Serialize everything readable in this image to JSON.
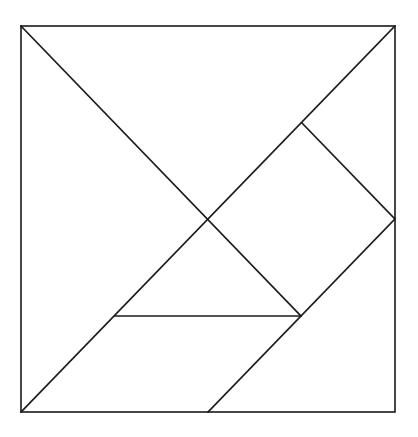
{
  "diagram": {
    "type": "tangram",
    "canvas": {
      "width": 418,
      "height": 437
    },
    "stroke_color": "#1a1a1a",
    "background": "#ffffff",
    "outer_square": {
      "x1": 21,
      "y1": 26,
      "x2": 395,
      "y2": 412
    },
    "pieces": [
      {
        "name": "large-triangle-top",
        "points": "21,26 395,26 208,219"
      },
      {
        "name": "large-triangle-left",
        "points": "21,26 208,219 21,412"
      },
      {
        "name": "square",
        "points": "302,123 395,219 301,316 208,219"
      },
      {
        "name": "small-triangle-middle",
        "points": "208,219 301,316 115,316"
      },
      {
        "name": "parallelogram",
        "points": "115,316 301,316 208,412 21,412"
      },
      {
        "name": "medium-triangle-bottom-right",
        "points": "395,219 395,412 208,412"
      },
      {
        "name": "small-triangle-right",
        "points": "302,123 395,26 395,219"
      }
    ]
  }
}
